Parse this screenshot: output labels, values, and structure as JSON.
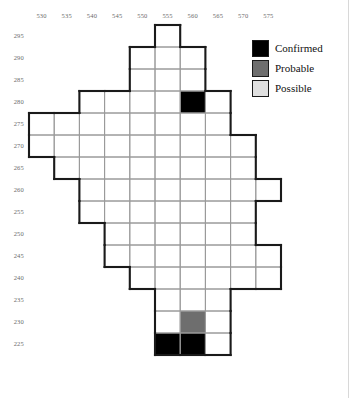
{
  "chart_data": {
    "type": "heatmap",
    "title": "",
    "xlabel": "",
    "ylabel": "",
    "x_tick_labels": [
      "530",
      "535",
      "540",
      "545",
      "550",
      "555",
      "560",
      "565",
      "570",
      "575"
    ],
    "y_tick_labels": [
      "295",
      "290",
      "285",
      "280",
      "275",
      "270",
      "265",
      "260",
      "255",
      "250",
      "245",
      "240",
      "235",
      "230",
      "225"
    ],
    "x_values": [
      530,
      535,
      540,
      545,
      550,
      555,
      560,
      565,
      570,
      575
    ],
    "y_values": [
      295,
      290,
      285,
      280,
      275,
      270,
      265,
      260,
      255,
      250,
      245,
      240,
      235,
      230,
      225
    ],
    "cell_size": {
      "width": 5,
      "height": 5
    },
    "grid": true,
    "legend_position": "top-right",
    "categories": [
      "Confirmed",
      "Probable",
      "Possible"
    ],
    "category_colors": {
      "Confirmed": "#000000",
      "Probable": "#6e6e6e",
      "Possible": "#e0e0e0"
    },
    "empty_color": "#ffffff",
    "grid_line_color": "#9a9a9a",
    "outline_color": "#1a1a1a",
    "cells": [
      {
        "x": 555,
        "y": 295,
        "status": "empty"
      },
      {
        "x": 550,
        "y": 290,
        "status": "empty"
      },
      {
        "x": 555,
        "y": 290,
        "status": "empty"
      },
      {
        "x": 560,
        "y": 290,
        "status": "empty"
      },
      {
        "x": 550,
        "y": 285,
        "status": "empty"
      },
      {
        "x": 555,
        "y": 285,
        "status": "empty"
      },
      {
        "x": 560,
        "y": 285,
        "status": "empty"
      },
      {
        "x": 540,
        "y": 280,
        "status": "empty"
      },
      {
        "x": 545,
        "y": 280,
        "status": "empty"
      },
      {
        "x": 550,
        "y": 280,
        "status": "empty"
      },
      {
        "x": 555,
        "y": 280,
        "status": "empty"
      },
      {
        "x": 560,
        "y": 280,
        "status": "Confirmed"
      },
      {
        "x": 565,
        "y": 280,
        "status": "empty"
      },
      {
        "x": 530,
        "y": 275,
        "status": "empty"
      },
      {
        "x": 535,
        "y": 275,
        "status": "empty"
      },
      {
        "x": 540,
        "y": 275,
        "status": "empty"
      },
      {
        "x": 545,
        "y": 275,
        "status": "empty"
      },
      {
        "x": 550,
        "y": 275,
        "status": "empty"
      },
      {
        "x": 555,
        "y": 275,
        "status": "empty"
      },
      {
        "x": 560,
        "y": 275,
        "status": "empty"
      },
      {
        "x": 565,
        "y": 275,
        "status": "empty"
      },
      {
        "x": 530,
        "y": 270,
        "status": "empty"
      },
      {
        "x": 535,
        "y": 270,
        "status": "empty"
      },
      {
        "x": 540,
        "y": 270,
        "status": "empty"
      },
      {
        "x": 545,
        "y": 270,
        "status": "empty"
      },
      {
        "x": 550,
        "y": 270,
        "status": "empty"
      },
      {
        "x": 555,
        "y": 270,
        "status": "empty"
      },
      {
        "x": 560,
        "y": 270,
        "status": "empty"
      },
      {
        "x": 565,
        "y": 270,
        "status": "empty"
      },
      {
        "x": 570,
        "y": 270,
        "status": "empty"
      },
      {
        "x": 535,
        "y": 265,
        "status": "empty"
      },
      {
        "x": 540,
        "y": 265,
        "status": "empty"
      },
      {
        "x": 545,
        "y": 265,
        "status": "empty"
      },
      {
        "x": 550,
        "y": 265,
        "status": "empty"
      },
      {
        "x": 555,
        "y": 265,
        "status": "empty"
      },
      {
        "x": 560,
        "y": 265,
        "status": "empty"
      },
      {
        "x": 565,
        "y": 265,
        "status": "empty"
      },
      {
        "x": 570,
        "y": 265,
        "status": "empty"
      },
      {
        "x": 540,
        "y": 260,
        "status": "empty"
      },
      {
        "x": 545,
        "y": 260,
        "status": "empty"
      },
      {
        "x": 550,
        "y": 260,
        "status": "empty"
      },
      {
        "x": 555,
        "y": 260,
        "status": "empty"
      },
      {
        "x": 560,
        "y": 260,
        "status": "empty"
      },
      {
        "x": 565,
        "y": 260,
        "status": "empty"
      },
      {
        "x": 570,
        "y": 260,
        "status": "empty"
      },
      {
        "x": 575,
        "y": 260,
        "status": "empty"
      },
      {
        "x": 540,
        "y": 255,
        "status": "empty"
      },
      {
        "x": 545,
        "y": 255,
        "status": "empty"
      },
      {
        "x": 550,
        "y": 255,
        "status": "empty"
      },
      {
        "x": 555,
        "y": 255,
        "status": "empty"
      },
      {
        "x": 560,
        "y": 255,
        "status": "empty"
      },
      {
        "x": 565,
        "y": 255,
        "status": "empty"
      },
      {
        "x": 570,
        "y": 255,
        "status": "empty"
      },
      {
        "x": 545,
        "y": 250,
        "status": "empty"
      },
      {
        "x": 550,
        "y": 250,
        "status": "empty"
      },
      {
        "x": 555,
        "y": 250,
        "status": "empty"
      },
      {
        "x": 560,
        "y": 250,
        "status": "empty"
      },
      {
        "x": 565,
        "y": 250,
        "status": "empty"
      },
      {
        "x": 570,
        "y": 250,
        "status": "empty"
      },
      {
        "x": 545,
        "y": 245,
        "status": "empty"
      },
      {
        "x": 550,
        "y": 245,
        "status": "empty"
      },
      {
        "x": 555,
        "y": 245,
        "status": "empty"
      },
      {
        "x": 560,
        "y": 245,
        "status": "empty"
      },
      {
        "x": 565,
        "y": 245,
        "status": "empty"
      },
      {
        "x": 570,
        "y": 245,
        "status": "empty"
      },
      {
        "x": 575,
        "y": 245,
        "status": "empty"
      },
      {
        "x": 550,
        "y": 240,
        "status": "empty"
      },
      {
        "x": 555,
        "y": 240,
        "status": "empty"
      },
      {
        "x": 560,
        "y": 240,
        "status": "empty"
      },
      {
        "x": 565,
        "y": 240,
        "status": "empty"
      },
      {
        "x": 570,
        "y": 240,
        "status": "empty"
      },
      {
        "x": 575,
        "y": 240,
        "status": "empty"
      },
      {
        "x": 555,
        "y": 235,
        "status": "empty"
      },
      {
        "x": 560,
        "y": 235,
        "status": "empty"
      },
      {
        "x": 565,
        "y": 235,
        "status": "empty"
      },
      {
        "x": 555,
        "y": 230,
        "status": "empty"
      },
      {
        "x": 560,
        "y": 230,
        "status": "Probable"
      },
      {
        "x": 565,
        "y": 230,
        "status": "empty"
      },
      {
        "x": 555,
        "y": 225,
        "status": "Confirmed"
      },
      {
        "x": 560,
        "y": 225,
        "status": "Confirmed"
      },
      {
        "x": 565,
        "y": 225,
        "status": "empty"
      }
    ]
  },
  "legend": {
    "items": [
      {
        "label": "Confirmed",
        "color": "#000000"
      },
      {
        "label": "Probable",
        "color": "#6e6e6e"
      },
      {
        "label": "Possible",
        "color": "#e0e0e0"
      }
    ]
  }
}
